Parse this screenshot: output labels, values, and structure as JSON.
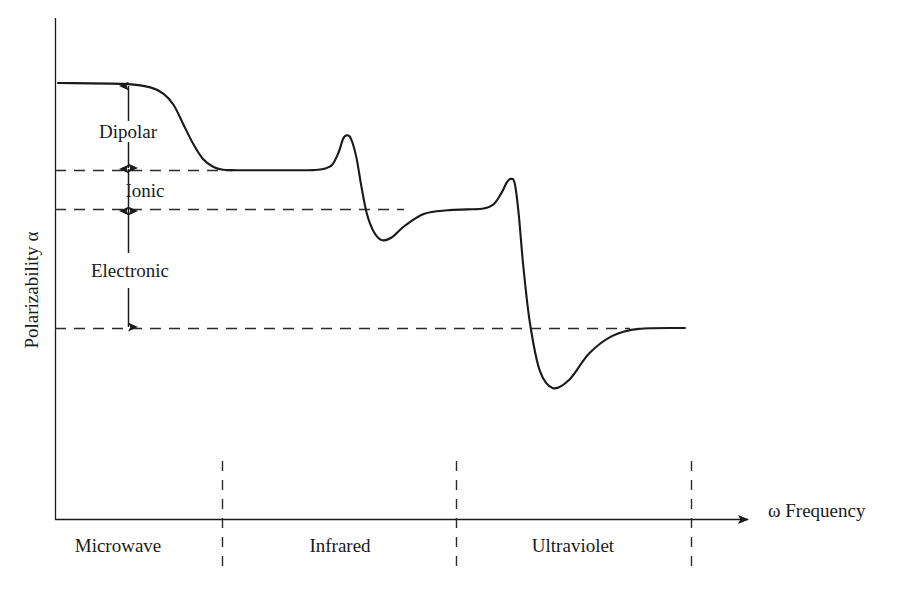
{
  "chart_data": {
    "type": "line",
    "title": "",
    "xlabel": "ω Frequency",
    "ylabel": "Polarizability α",
    "grid": false,
    "legend": null,
    "axis_style": {
      "x_axis_arrow": true,
      "y_axis_arrow": false,
      "tick_labels": false,
      "numeric_scale": false
    },
    "x_bands": [
      {
        "label": "Microwave",
        "center_frac": 0.09
      },
      {
        "label": "Infrared",
        "center_frac": 0.41
      },
      {
        "label": "Ultraviolet",
        "center_frac": 0.73
      }
    ],
    "band_dividers_frac": [
      0.239,
      0.574,
      0.91
    ],
    "levels": [
      {
        "name": "total_static",
        "value_frac": 1.0,
        "dashed": false
      },
      {
        "name": "ionic_plus_electronic",
        "value_frac": 0.8,
        "dashed": true
      },
      {
        "name": "electronic",
        "value_frac": 0.711,
        "dashed": true
      },
      {
        "name": "baseline",
        "value_frac": 0.438,
        "dashed": true
      }
    ],
    "contributions": [
      {
        "label": "Dipolar",
        "from_frac": 1.0,
        "to_frac": 0.8
      },
      {
        "label": "Ionic",
        "from_frac": 0.8,
        "to_frac": 0.711
      },
      {
        "label": "Electronic",
        "from_frac": 0.711,
        "to_frac": 0.438
      }
    ],
    "series": [
      {
        "name": "polarizability",
        "x": [
          0.0,
          0.1,
          0.14,
          0.16,
          0.175,
          0.19,
          0.205,
          0.22,
          0.235,
          0.25,
          0.27,
          0.3,
          0.34,
          0.38,
          0.4,
          0.415,
          0.425,
          0.432,
          0.438,
          0.444,
          0.452,
          0.46,
          0.468,
          0.478,
          0.49,
          0.505,
          0.525,
          0.555,
          0.59,
          0.62,
          0.645,
          0.66,
          0.672,
          0.68,
          0.686,
          0.692,
          0.698,
          0.705,
          0.715,
          0.73,
          0.75,
          0.775,
          0.805,
          0.84,
          0.88,
          0.95
        ],
        "y": [
          1.0,
          0.998,
          0.99,
          0.975,
          0.95,
          0.905,
          0.86,
          0.825,
          0.808,
          0.801,
          0.8,
          0.8,
          0.8,
          0.8,
          0.802,
          0.812,
          0.84,
          0.872,
          0.88,
          0.872,
          0.83,
          0.76,
          0.7,
          0.66,
          0.64,
          0.645,
          0.672,
          0.7,
          0.708,
          0.71,
          0.712,
          0.722,
          0.748,
          0.772,
          0.78,
          0.77,
          0.7,
          0.58,
          0.45,
          0.34,
          0.3,
          0.32,
          0.38,
          0.42,
          0.436,
          0.438
        ]
      }
    ]
  },
  "axes": {
    "y_axis_label": "Polarizability α",
    "x_axis_label": "ω Frequency",
    "omega_symbol": "ω",
    "alpha_symbol": "α"
  },
  "annotations": {
    "dipolar": "Dipolar",
    "ionic": "Ionic",
    "electronic": "Electronic"
  },
  "bands": {
    "microwave": "Microwave",
    "infrared": "Infrared",
    "ultraviolet": "Ultraviolet"
  },
  "colors": {
    "ink": "#1a1a1a",
    "curve": "#1a1a1a",
    "dashed": "#2b2b2b",
    "background": "#ffffff"
  }
}
